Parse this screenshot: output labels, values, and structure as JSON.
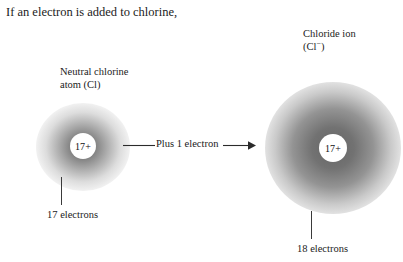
{
  "figure": {
    "intro_text": "If an electron is added to chlorine,",
    "background_color": "#ffffff",
    "text_color": "#1a1a1a",
    "cloud_color": "#6e6e6e"
  },
  "atom": {
    "label_line1": "Neutral chlorine",
    "label_line2": "atom (Cl)",
    "nucleus_charge": "17+",
    "electron_count_label": "17 electrons"
  },
  "ion": {
    "label_line1": "Chloride ion",
    "label_prefix": "(Cl",
    "label_charge": "−",
    "label_suffix": ")",
    "nucleus_charge": "17+",
    "electron_count_label": "18 electrons"
  },
  "arrow": {
    "label": "Plus 1 electron",
    "direction": "right"
  }
}
